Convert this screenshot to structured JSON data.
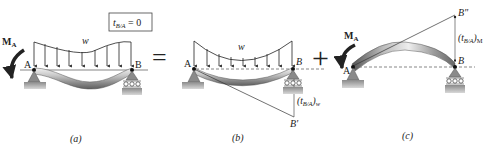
{
  "panels": {
    "a": {
      "caption": "(a)",
      "condition_box": "t_{B/A} = 0",
      "condition_main": "t",
      "condition_sub": "B/A",
      "condition_rest": " = 0",
      "load_label": "w",
      "moment_label": "M",
      "moment_sub": "A",
      "point_a": "A",
      "point_b": "B"
    },
    "b": {
      "caption": "(b)",
      "load_label": "w",
      "point_a": "A",
      "point_b": "B",
      "point_b_prime": "B'",
      "deviation_open": "(t",
      "deviation_sub": "B/A",
      "deviation_close": ")",
      "deviation_subscript2": "w"
    },
    "c": {
      "caption": "(c)",
      "moment_label": "M",
      "moment_sub": "A",
      "point_a": "A",
      "point_b": "B",
      "point_b_double_prime": "B\"",
      "deviation_open": "(t",
      "deviation_sub": "B/A",
      "deviation_close": ")",
      "deviation_subscript2": "M"
    }
  },
  "operators": {
    "equals": "=",
    "plus": "+"
  },
  "colors": {
    "line": "#222222",
    "beam_light": "#e6e6e6",
    "beam_dark": "#7a7a7a",
    "support": "#8a8a8a",
    "ground": "#9a9a9a"
  }
}
